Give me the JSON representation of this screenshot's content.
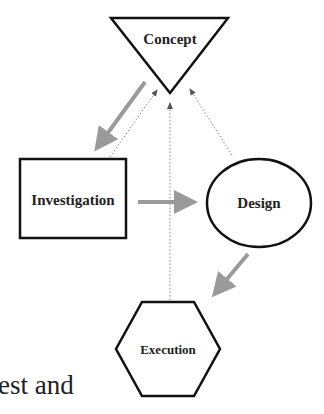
{
  "diagram": {
    "nodes": [
      {
        "id": "concept",
        "label": "Concept",
        "shape": "inverted-triangle"
      },
      {
        "id": "investigation",
        "label": "Investigation",
        "shape": "rectangle"
      },
      {
        "id": "design",
        "label": "Design",
        "shape": "ellipse"
      },
      {
        "id": "execution",
        "label": "Execution",
        "shape": "hexagon"
      }
    ],
    "edges": [
      {
        "from": "concept",
        "to": "investigation",
        "style": "solid-gray-thick"
      },
      {
        "from": "investigation",
        "to": "design",
        "style": "solid-gray-thick"
      },
      {
        "from": "design",
        "to": "execution",
        "style": "solid-gray-thick"
      },
      {
        "from": "investigation",
        "to": "concept",
        "style": "dotted"
      },
      {
        "from": "execution",
        "to": "concept",
        "style": "dotted"
      },
      {
        "from": "design",
        "to": "concept",
        "style": "dotted"
      }
    ],
    "colors": {
      "outline": "#111111",
      "flow_arrow": "#9a9a9a",
      "feedback_arrow": "#777777"
    }
  },
  "body_text": {
    "fragment": "est and"
  }
}
